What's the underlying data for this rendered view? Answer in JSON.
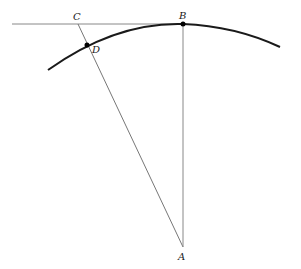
{
  "diagram": {
    "type": "geometry",
    "labels": {
      "A": "A",
      "B": "B",
      "C": "C",
      "D": "D"
    },
    "points": {
      "A": [
        183,
        247
      ],
      "B": [
        183,
        24
      ],
      "C": [
        78,
        24
      ],
      "D": [
        87,
        45
      ]
    },
    "elements": [
      {
        "kind": "tangent-line",
        "from": "left-edge",
        "to": "B"
      },
      {
        "kind": "segment",
        "from": "C",
        "to": "A"
      },
      {
        "kind": "segment",
        "from": "B",
        "to": "A"
      },
      {
        "kind": "arc",
        "through": [
          "D",
          "B"
        ],
        "center": "A"
      }
    ],
    "colors": {
      "arc": "#1a1a1a",
      "lines": "#777777",
      "points": "#000000"
    }
  }
}
